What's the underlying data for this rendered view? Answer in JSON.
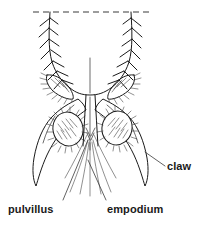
{
  "figure": {
    "background_color": "#ffffff",
    "ink_color": "#1a1a1a",
    "width": 202,
    "height": 230
  },
  "labels": [
    {
      "id": "pulvillus",
      "text": "pulvillus",
      "x": 8,
      "y": 204,
      "leader": {
        "from_x": 63,
        "from_y": 200,
        "to_x": 88,
        "to_y": 140
      },
      "icon": "label-leader-icon"
    },
    {
      "id": "empodium",
      "text": "empodium",
      "x": 107,
      "y": 204,
      "leader": {
        "from_x": 106,
        "from_y": 200,
        "to_x": 88,
        "to_y": 160
      },
      "icon": "label-leader-icon"
    },
    {
      "id": "claw",
      "text": "claw",
      "x": 167,
      "y": 161,
      "leader": {
        "from_x": 165,
        "from_y": 166,
        "to_x": 145,
        "to_y": 152
      },
      "icon": "label-leader-icon"
    }
  ],
  "structures": {
    "cut_line": {
      "name": "dashed-cut-line",
      "x1": 33,
      "y1": 12,
      "x2": 149,
      "y2": 12
    },
    "tarsus_segment": {
      "name": "tarsal-segment",
      "left_margin_x": 48,
      "right_margin_x": 133
    },
    "claws": [
      {
        "name": "left-claw",
        "side": "left",
        "tip_x": 40,
        "tip_y": 185
      },
      {
        "name": "right-claw",
        "side": "right",
        "tip_x": 148,
        "tip_y": 186
      }
    ],
    "pulvilli": [
      {
        "name": "left-pulvillus",
        "side": "left",
        "cx": 68,
        "cy": 129,
        "rx": 15,
        "ry": 17
      },
      {
        "name": "right-pulvillus",
        "side": "right",
        "cx": 117,
        "cy": 128,
        "rx": 15,
        "ry": 17
      }
    ],
    "empodium": {
      "name": "empodium-bristle",
      "cx": 90,
      "top_y": 95,
      "bottom_y": 196
    },
    "setae": {
      "name": "marginal-setae",
      "description": "bristles along tarsal margins"
    }
  }
}
